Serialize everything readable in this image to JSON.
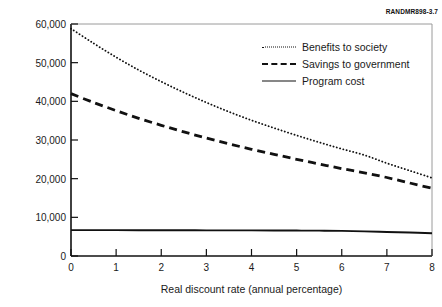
{
  "figure_id": "RANDMR898-3.7",
  "chart_data": {
    "type": "line",
    "title": "",
    "xlabel": "Real discount rate (annual percentage)",
    "ylabel": "NPV dollars per child",
    "xlim": [
      0,
      8
    ],
    "ylim": [
      0,
      60000
    ],
    "grid": false,
    "legend_position": "upper-right-inside",
    "xticks": [
      "0",
      "1",
      "2",
      "3",
      "4",
      "5",
      "6",
      "7",
      "8"
    ],
    "yticks": [
      "0",
      "10,000",
      "20,000",
      "30,000",
      "40,000",
      "50,000",
      "60,000"
    ],
    "x": [
      0,
      0.5,
      1,
      1.5,
      2,
      2.5,
      3,
      3.5,
      4,
      4.5,
      5,
      5.5,
      6,
      6.5,
      7,
      7.5,
      8
    ],
    "series": [
      {
        "name": "Benefits to society",
        "style": "dotted",
        "color": "#111111",
        "values": [
          58800,
          55000,
          51400,
          48100,
          45100,
          42300,
          39700,
          37300,
          35100,
          33100,
          31200,
          29400,
          27700,
          26100,
          24000,
          22100,
          20200
        ]
      },
      {
        "name": "Savings to government",
        "style": "dashed",
        "color": "#111111",
        "values": [
          42000,
          39700,
          37600,
          35600,
          33800,
          32100,
          30500,
          29000,
          27600,
          26300,
          25000,
          23800,
          22600,
          21500,
          20300,
          18900,
          17500
        ]
      },
      {
        "name": "Program cost",
        "style": "solid",
        "color": "#111111",
        "values": [
          6700,
          6690,
          6680,
          6670,
          6660,
          6650,
          6640,
          6630,
          6620,
          6600,
          6580,
          6550,
          6500,
          6380,
          6220,
          6060,
          5900
        ]
      }
    ]
  },
  "legend": {
    "items": [
      {
        "label": "Benefits to society"
      },
      {
        "label": "Savings to government"
      },
      {
        "label": "Program cost"
      }
    ]
  }
}
